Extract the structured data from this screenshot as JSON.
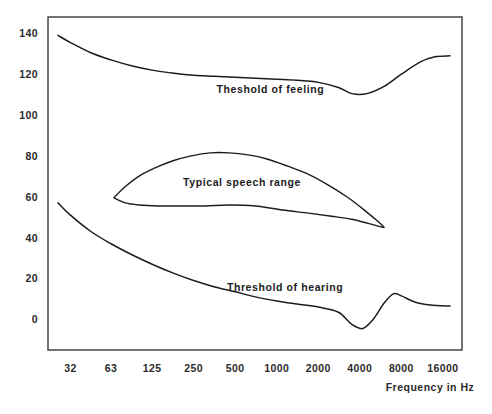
{
  "chart_data": {
    "type": "line",
    "title": "",
    "xlabel": "Frequency in Hz",
    "ylabel": "",
    "xscale": "log",
    "xlim": [
      22,
      22000
    ],
    "ylim": [
      -15,
      148
    ],
    "grid": false,
    "legend": "none",
    "x_tick_labels": [
      "32",
      "63",
      "125",
      "250",
      "500",
      "1000",
      "2000",
      "4000",
      "8000",
      "16000"
    ],
    "x_tick_values": [
      32,
      63,
      125,
      250,
      500,
      1000,
      2000,
      4000,
      8000,
      16000
    ],
    "y_tick_labels": [
      "0",
      "20",
      "40",
      "60",
      "80",
      "100",
      "120",
      "140"
    ],
    "y_tick_values": [
      0,
      20,
      40,
      60,
      80,
      100,
      120,
      140
    ],
    "series": [
      {
        "name": "Theshold of feeling",
        "label": "Theshold of feeling",
        "label_x": 900,
        "label_y": 113,
        "x": [
          26,
          32,
          45,
          63,
          90,
          125,
          180,
          250,
          350,
          500,
          700,
          1000,
          1400,
          2000,
          2800,
          3500,
          4500,
          6000,
          8000,
          11000,
          14000,
          18000
        ],
        "y": [
          139,
          135.5,
          130.5,
          127,
          124,
          122,
          120.5,
          119.5,
          119,
          118.5,
          118,
          117.5,
          117,
          116,
          113.5,
          110.5,
          110.5,
          114,
          120,
          126,
          128.5,
          129
        ]
      },
      {
        "name": "Threshold of hearing",
        "label": "Threshold of hearing",
        "label_x": 1150,
        "label_y": 16,
        "x": [
          26,
          32,
          45,
          63,
          90,
          125,
          180,
          250,
          350,
          500,
          700,
          1000,
          1400,
          2000,
          2800,
          3500,
          4200,
          5000,
          6000,
          7000,
          8000,
          10000,
          13000,
          18000
        ],
        "y": [
          57,
          51,
          43,
          37,
          31.5,
          27,
          22.5,
          19,
          16,
          13.5,
          11,
          9,
          7.5,
          6,
          3.5,
          -2.5,
          -4.5,
          0,
          8,
          12.5,
          11.5,
          8.5,
          7,
          6.5
        ]
      }
    ],
    "regions": [
      {
        "name": "Typical speech range",
        "label": "Typical speech range",
        "label_x": 560,
        "label_y": 67,
        "upper_x": [
          66,
          80,
          100,
          130,
          175,
          240,
          330,
          450,
          620,
          850,
          1200,
          1700,
          2400,
          3300,
          4400,
          5400,
          6000
        ],
        "upper_y": [
          59.5,
          65,
          70,
          74,
          77.5,
          80,
          81.5,
          81.5,
          80.5,
          78.5,
          75,
          71,
          65.5,
          59.5,
          53,
          48,
          45
        ],
        "lower_x": [
          66,
          80,
          100,
          140,
          200,
          300,
          450,
          700,
          1100,
          1700,
          2500,
          3500,
          4600,
          5500,
          6000
        ],
        "lower_y": [
          59.5,
          57,
          56,
          55.5,
          55.5,
          55.5,
          56,
          55.5,
          53.5,
          52,
          50.5,
          49,
          47,
          45.5,
          45
        ]
      }
    ]
  },
  "axes": {
    "x_title": "Frequency in Hz"
  }
}
